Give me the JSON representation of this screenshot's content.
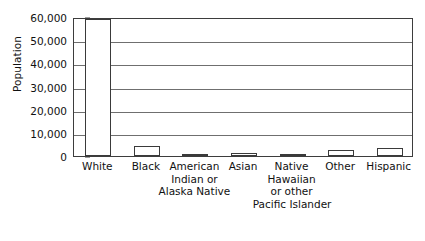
{
  "chart_data": {
    "type": "bar",
    "title": "",
    "xlabel": "",
    "ylabel": "Population",
    "ylim": [
      0,
      60000
    ],
    "ytick_values": [
      0,
      10000,
      20000,
      30000,
      40000,
      50000,
      60000
    ],
    "ytick_labels": [
      "0",
      "10,000",
      "20,000",
      "30,000",
      "40,000",
      "50,000",
      "60,000"
    ],
    "grid": true,
    "grid_axis": "y",
    "legend": false,
    "bar_fill_color": "#ffffff",
    "bar_edge_color": "#3a3a3a",
    "categories": [
      "White",
      "Black",
      "American Indian or Alaska Native",
      "Asian",
      "Native Hawaiian or other Pacific Islander",
      "Other",
      "Hispanic"
    ],
    "category_label_lines": [
      [
        "White"
      ],
      [
        "Black"
      ],
      [
        "American",
        "Indian or",
        "Alaska Native"
      ],
      [
        "Asian"
      ],
      [
        "Native",
        "Hawaiian",
        "or other",
        "Pacific Islander"
      ],
      [
        "Other"
      ],
      [
        "Hispanic"
      ]
    ],
    "values": [
      59000,
      4200,
      700,
      1400,
      500,
      2400,
      3600
    ]
  }
}
